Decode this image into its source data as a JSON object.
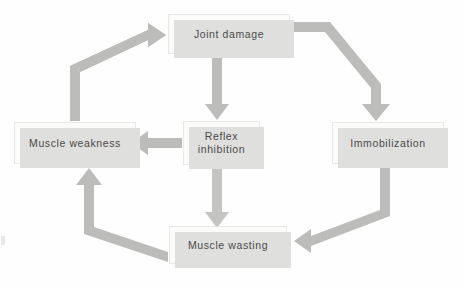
{
  "diagram": {
    "background_color": "#fefefe",
    "box_fill_color": "#fbfbfa",
    "box_shadow_color": "#dfdfdd",
    "arrow_color": "#b9b9b7",
    "text_color": "#4a4a4a",
    "nodes": [
      {
        "id": "joint-damage",
        "label": "Joint damage",
        "x": 168,
        "y": 14,
        "w": 122,
        "h": 40
      },
      {
        "id": "muscle-weakness",
        "label": "Muscle weakness",
        "x": 14,
        "y": 122,
        "w": 122,
        "h": 42
      },
      {
        "id": "reflex-inhibition",
        "label": "Reflex\ninhibition",
        "line1": "Reflex",
        "line2": "inhibition",
        "x": 183,
        "y": 121,
        "w": 77,
        "h": 44
      },
      {
        "id": "immobilization",
        "label": "Immobilization",
        "x": 332,
        "y": 122,
        "w": 112,
        "h": 42
      },
      {
        "id": "muscle-wasting",
        "label": "Muscle wasting",
        "x": 169,
        "y": 226,
        "w": 118,
        "h": 38
      }
    ],
    "edges": [
      {
        "id": "joint-damage-to-reflex-inhibition",
        "from": "joint-damage",
        "to": "reflex-inhibition",
        "shape": "straight-down"
      },
      {
        "id": "joint-damage-to-immobilization",
        "from": "joint-damage",
        "to": "immobilization",
        "shape": "right-then-diagonal-down"
      },
      {
        "id": "reflex-inhibition-to-muscle-weakness",
        "from": "reflex-inhibition",
        "to": "muscle-weakness",
        "shape": "straight-left"
      },
      {
        "id": "reflex-inhibition-to-muscle-wasting",
        "from": "reflex-inhibition",
        "to": "muscle-wasting",
        "shape": "straight-down"
      },
      {
        "id": "immobilization-to-muscle-wasting",
        "from": "immobilization",
        "to": "muscle-wasting",
        "shape": "down-then-diagonal-left"
      },
      {
        "id": "muscle-wasting-to-muscle-weakness",
        "from": "muscle-wasting",
        "to": "muscle-weakness",
        "shape": "left-diagonal-then-up"
      },
      {
        "id": "muscle-weakness-to-joint-damage",
        "from": "muscle-weakness",
        "to": "joint-damage",
        "shape": "up-then-diagonal-right"
      }
    ]
  }
}
